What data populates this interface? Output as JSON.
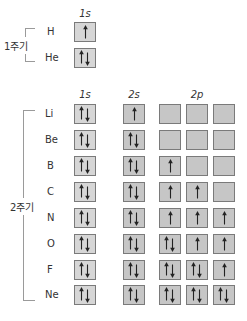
{
  "colors": {
    "box_fill_1s": "#d6d6d6",
    "box_fill_2": "#c6c6c6",
    "box_border": "#7a7a7a",
    "arrow": "#222222",
    "bracket": "#9a9a9a",
    "text": "#333333"
  },
  "period1": {
    "label": "1주기",
    "headers": {
      "s1": "1s"
    },
    "elements": [
      {
        "symbol": "H",
        "orbitals": {
          "1s": "up"
        }
      },
      {
        "symbol": "He",
        "orbitals": {
          "1s": "pair"
        }
      }
    ]
  },
  "period2": {
    "label": "2주기",
    "headers": {
      "s1": "1s",
      "s2": "2s",
      "p2": "2p"
    },
    "elements": [
      {
        "symbol": "Li",
        "orbitals": {
          "1s": "pair",
          "2s": "up",
          "2p": [
            "empty",
            "empty",
            "empty"
          ]
        }
      },
      {
        "symbol": "Be",
        "orbitals": {
          "1s": "pair",
          "2s": "pair",
          "2p": [
            "empty",
            "empty",
            "empty"
          ]
        }
      },
      {
        "symbol": "B",
        "orbitals": {
          "1s": "pair",
          "2s": "pair",
          "2p": [
            "up",
            "empty",
            "empty"
          ]
        }
      },
      {
        "symbol": "C",
        "orbitals": {
          "1s": "pair",
          "2s": "pair",
          "2p": [
            "up",
            "up",
            "empty"
          ]
        }
      },
      {
        "symbol": "N",
        "orbitals": {
          "1s": "pair",
          "2s": "pair",
          "2p": [
            "up",
            "up",
            "up"
          ]
        }
      },
      {
        "symbol": "O",
        "orbitals": {
          "1s": "pair",
          "2s": "pair",
          "2p": [
            "pair",
            "up",
            "up"
          ]
        }
      },
      {
        "symbol": "F",
        "orbitals": {
          "1s": "pair",
          "2s": "pair",
          "2p": [
            "pair",
            "pair",
            "up"
          ]
        }
      },
      {
        "symbol": "Ne",
        "orbitals": {
          "1s": "pair",
          "2s": "pair",
          "2p": [
            "pair",
            "pair",
            "pair"
          ]
        }
      }
    ]
  }
}
